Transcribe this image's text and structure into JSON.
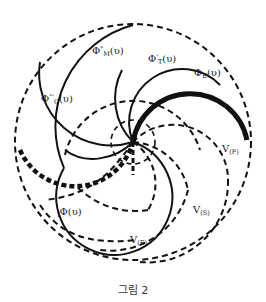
{
  "figure": {
    "caption": "그림 2",
    "pivot": {
      "x": 133,
      "y": 142
    },
    "colors": {
      "stroke": "#111111",
      "background": "#ffffff"
    }
  },
  "labels": {
    "phi_m": {
      "base": "Φ",
      "sup": "\"",
      "sub": "M",
      "arg": "(υ)"
    },
    "phi_t": {
      "base": "Φ",
      "sup": "'",
      "sub": "T",
      "arg": "(υ)"
    },
    "phi_e": {
      "base": "Φ",
      "sub": "E",
      "arg": "(υ)"
    },
    "phi_c": {
      "base": "Φ",
      "sup": "\"'",
      "sub": "C",
      "arg": "(υ)"
    },
    "phi_i": {
      "pre": "I",
      "base": "Φ",
      "arg": "(υ)"
    },
    "v_p": {
      "base": "V",
      "sub": "(P)"
    },
    "v_s": {
      "base": "V",
      "sub": "(S)"
    },
    "v_e": {
      "base": "V",
      "sub": "(E)"
    }
  },
  "curves": [
    {
      "name": "outer-circle",
      "style": "dashed"
    },
    {
      "name": "phi-m-arc",
      "style": "solid"
    },
    {
      "name": "phi-t-arc",
      "style": "solid"
    },
    {
      "name": "phi-e-arc",
      "style": "thick-solid"
    },
    {
      "name": "phi-c-arc",
      "style": "solid"
    },
    {
      "name": "phi-i-arc",
      "style": "thick-dashed"
    },
    {
      "name": "v-p-arc",
      "style": "dashed"
    },
    {
      "name": "v-s-arc",
      "style": "dashed"
    },
    {
      "name": "v-e-arc",
      "style": "dashed"
    }
  ]
}
